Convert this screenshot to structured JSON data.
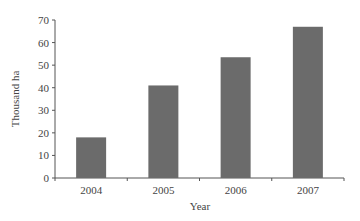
{
  "chart_data": {
    "type": "bar",
    "title": "",
    "xlabel": "Year",
    "ylabel": "Thousand ha",
    "categories": [
      "2004",
      "2005",
      "2006",
      "2007"
    ],
    "values": [
      18,
      41,
      53.5,
      67
    ],
    "ylim": [
      0,
      70
    ],
    "yticks": [
      0,
      10,
      20,
      30,
      40,
      50,
      60,
      70
    ],
    "grid": false,
    "legend": null,
    "bar_color": "#6b6b6b"
  }
}
